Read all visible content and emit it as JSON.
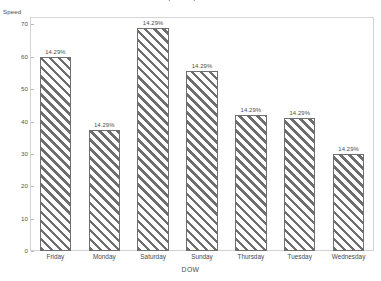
{
  "chart_data": {
    "type": "bar",
    "title": "Speed by DOW",
    "xlabel": "DOW",
    "ylabel": "Speed",
    "categories": [
      "Friday",
      "Monday",
      "Saturday",
      "Sunday",
      "Thursday",
      "Tuesday",
      "Wednesday"
    ],
    "values": [
      60,
      37.5,
      69,
      55.6,
      42,
      41,
      30
    ],
    "data_labels": [
      "14.29%",
      "14.29%",
      "14.29%",
      "14.29%",
      "14.29%",
      "14.29%",
      "14.29%"
    ],
    "ylim": [
      0,
      72
    ],
    "yticks": [
      0,
      10,
      20,
      30,
      40,
      50,
      60,
      70
    ],
    "ytick_labels": [
      "0",
      "10",
      "20",
      "30",
      "40",
      "50",
      "60",
      "70"
    ],
    "grid": false,
    "legend": null,
    "bar_fill": "diagonal-hatch",
    "colors": {
      "bar_outline": "#6f6f6f",
      "bar_hatch": "#6e6e6e",
      "bar_background": "#ffffff",
      "plot_border": "#d2d2d2",
      "text": "#4a4a4a",
      "tick_mark": "#b9b9b9"
    }
  }
}
